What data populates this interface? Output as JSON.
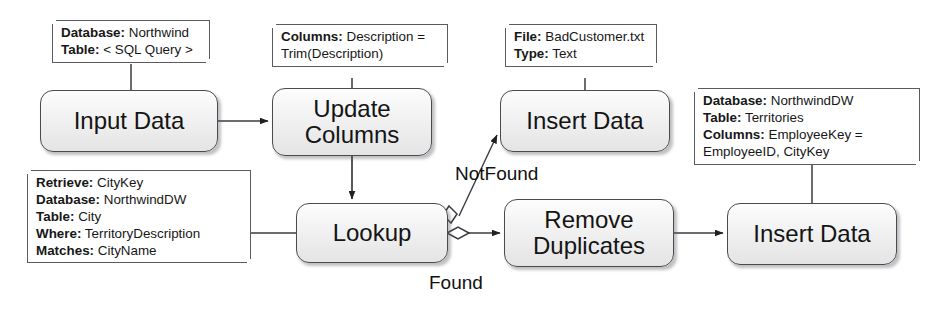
{
  "diagram": {
    "background_color": "#ffffff",
    "node_fill": "#f0f0f0",
    "node_border_color": "#4a4a52",
    "line_color": "#3a3a40",
    "nodes": [
      {
        "id": "input-data",
        "label": "Input Data",
        "x": 40,
        "y": 90,
        "w": 178,
        "h": 62,
        "font_size": 24
      },
      {
        "id": "update-columns",
        "label": "Update\nColumns",
        "x": 272,
        "y": 88,
        "w": 160,
        "h": 68,
        "font_size": 24
      },
      {
        "id": "insert-data-bad",
        "label": "Insert Data",
        "x": 500,
        "y": 90,
        "w": 170,
        "h": 62,
        "font_size": 24
      },
      {
        "id": "lookup",
        "label": "Lookup",
        "x": 296,
        "y": 203,
        "w": 152,
        "h": 60,
        "font_size": 24
      },
      {
        "id": "remove-duplicates",
        "label": "Remove\nDuplicates",
        "x": 504,
        "y": 199,
        "w": 170,
        "h": 68,
        "font_size": 24
      },
      {
        "id": "insert-data-dw",
        "label": "Insert Data",
        "x": 727,
        "y": 203,
        "w": 170,
        "h": 62,
        "font_size": 24
      }
    ],
    "notes": [
      {
        "id": "note-input-data",
        "attached_to": "input-data",
        "x": 52,
        "y": 20,
        "w": 158,
        "lines": [
          {
            "key": "Database:",
            "value": " Northwind"
          },
          {
            "key": "Table:",
            "value": " < SQL Query >"
          }
        ]
      },
      {
        "id": "note-update-columns",
        "attached_to": "update-columns",
        "x": 272,
        "y": 24,
        "w": 176,
        "lines": [
          {
            "key": "Columns:",
            "value": " Description ="
          },
          {
            "key": "",
            "value": "Trim(Description)"
          }
        ]
      },
      {
        "id": "note-insert-data-bad",
        "attached_to": "insert-data-bad",
        "x": 505,
        "y": 24,
        "w": 152,
        "lines": [
          {
            "key": "File:",
            "value": " BadCustomer.txt"
          },
          {
            "key": "Type:",
            "value": " Text"
          }
        ]
      },
      {
        "id": "note-insert-data-dw",
        "attached_to": "insert-data-dw",
        "x": 694,
        "y": 88,
        "w": 226,
        "lines": [
          {
            "key": "Database:",
            "value": " NorthwindDW"
          },
          {
            "key": "Table:",
            "value": " Territories"
          },
          {
            "key": "Columns:",
            "value": " EmployeeKey ="
          },
          {
            "key": "",
            "value": "EmployeeID, CityKey"
          }
        ]
      },
      {
        "id": "note-lookup",
        "attached_to": "lookup",
        "x": 27,
        "y": 170,
        "w": 224,
        "lines": [
          {
            "key": "Retrieve:",
            "value": " CityKey"
          },
          {
            "key": "Database:",
            "value": " NorthwindDW"
          },
          {
            "key": "Table:",
            "value": " City"
          },
          {
            "key": "Where:",
            "value": " TerritoryDescription"
          },
          {
            "key": "Matches:",
            "value": " CityName"
          }
        ]
      }
    ],
    "branch_labels": [
      {
        "id": "label-notfound",
        "text": "NotFound",
        "x": 455,
        "y": 163
      },
      {
        "id": "label-found",
        "text": "Found",
        "x": 429,
        "y": 272
      }
    ],
    "edges": [
      {
        "id": "edge-input-to-update",
        "from": "input-data",
        "to": "update-columns",
        "kind": "arrow"
      },
      {
        "id": "edge-update-to-lookup",
        "from": "update-columns",
        "to": "lookup",
        "kind": "arrow"
      },
      {
        "id": "edge-lookup-notfound",
        "from": "lookup",
        "to": "insert-data-bad",
        "kind": "arrow",
        "label": "NotFound"
      },
      {
        "id": "edge-lookup-found",
        "from": "lookup",
        "to": "remove-duplicates",
        "kind": "arrow",
        "label": "Found"
      },
      {
        "id": "edge-dedupe-to-insert",
        "from": "remove-duplicates",
        "to": "insert-data-dw",
        "kind": "arrow"
      },
      {
        "id": "edge-note-input",
        "from": "note-input-data",
        "to": "input-data",
        "kind": "stem"
      },
      {
        "id": "edge-note-update",
        "from": "note-update-columns",
        "to": "update-columns",
        "kind": "stem"
      },
      {
        "id": "edge-note-insert-bad",
        "from": "note-insert-data-bad",
        "to": "insert-data-bad",
        "kind": "stem"
      },
      {
        "id": "edge-note-insert-dw",
        "from": "note-insert-data-dw",
        "to": "insert-data-dw",
        "kind": "stem"
      },
      {
        "id": "edge-note-lookup",
        "from": "note-lookup",
        "to": "lookup",
        "kind": "stem"
      }
    ]
  }
}
